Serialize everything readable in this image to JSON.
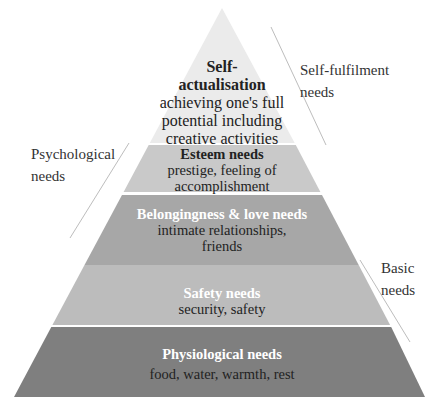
{
  "diagram": {
    "layers": [
      {
        "id": "self-actualisation",
        "title_lines": [
          "Self-",
          "actualisation"
        ],
        "description_lines": [
          "achieving one's full",
          "potential including",
          "creative activities"
        ],
        "color": "#ebebeb",
        "title_color": "#222222"
      },
      {
        "id": "esteem",
        "title": "Esteem needs",
        "description_lines": [
          "prestige, feeling of",
          "accomplishment"
        ],
        "color": "#c9c9c9",
        "title_color": "#222222"
      },
      {
        "id": "belongingness",
        "title": "Belongingness & love needs",
        "description_lines": [
          "intimate relationships,",
          "friends"
        ],
        "color": "#a7a7a7",
        "title_color": "#ffffff"
      },
      {
        "id": "safety",
        "title": "Safety needs",
        "description_lines": [
          "security, safety"
        ],
        "color": "#bcbcbc",
        "title_color": "#ffffff"
      },
      {
        "id": "physiological",
        "title": "Physiological needs",
        "description_lines": [
          "food, water, warmth, rest"
        ],
        "color": "#7f7f7f",
        "title_color": "#ffffff"
      }
    ],
    "groups": [
      {
        "id": "self-fulfilment",
        "lines": [
          "Self-fulfilment",
          "needs"
        ]
      },
      {
        "id": "psychological",
        "lines": [
          "Psychological",
          "needs"
        ]
      },
      {
        "id": "basic",
        "lines": [
          "Basic",
          "needs"
        ]
      }
    ]
  }
}
